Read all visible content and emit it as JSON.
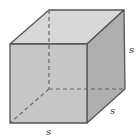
{
  "diagram": {
    "shape": "cube",
    "labels": {
      "bottom_edge": "s",
      "depth_edge": "s",
      "height_edge": "s"
    },
    "colors": {
      "top_face": "#d8d8d8",
      "front_face": "#c6c6c6",
      "right_face": "#afafaf",
      "edge": "#555555",
      "hidden_edge": "#666666"
    }
  }
}
